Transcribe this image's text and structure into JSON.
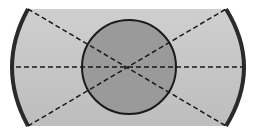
{
  "diagram": {
    "colors": {
      "background": "#ffffff",
      "panel_fill": "#c4c4c4",
      "circle_fill": "#9a9a9a",
      "edge_stroke": "#2a2a2a",
      "dash_stroke": "#1a1a1a"
    },
    "panel": {
      "top": 9,
      "bottom": 126,
      "left_x": 28,
      "right_x": 226,
      "bulge_left_x": 14,
      "bulge_right_x": 244
    },
    "circle": {
      "cx": 129,
      "cy": 67,
      "r": 47
    },
    "dashed_lines": [
      {
        "name": "horizontal",
        "x1": 14,
        "y1": 67,
        "x2": 244,
        "y2": 67
      },
      {
        "name": "diagonal-down",
        "x1": 28,
        "y1": 9,
        "x2": 226,
        "y2": 126
      },
      {
        "name": "diagonal-up",
        "x1": 28,
        "y1": 126,
        "x2": 226,
        "y2": 9
      }
    ]
  }
}
